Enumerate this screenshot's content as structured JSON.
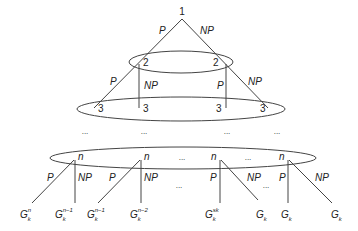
{
  "diagram": {
    "root": {
      "label": "1"
    },
    "edge_labels": {
      "p": "P",
      "np": "NP"
    },
    "level2": [
      {
        "label": "2"
      },
      {
        "label": "2"
      }
    ],
    "level3": [
      {
        "label": "3"
      },
      {
        "label": "3"
      },
      {
        "label": "3"
      },
      {
        "label": "3"
      }
    ],
    "ellipsis": "...",
    "leveln": [
      {
        "label": "n"
      },
      {
        "label": "n"
      },
      {
        "label": "n"
      },
      {
        "label": "n"
      }
    ],
    "leaves": [
      {
        "base": "G",
        "sub": "k",
        "sup": "n"
      },
      {
        "base": "G",
        "sub": "k",
        "sup": "n−1"
      },
      {
        "base": "G",
        "sub": "k",
        "sup": "n−1"
      },
      {
        "base": "G",
        "sub": "k",
        "sup": "n−2"
      },
      {
        "base": "G",
        "sub": "k",
        "sup": "sk"
      },
      {
        "base": "G",
        "sub": "k",
        "sup": ""
      },
      {
        "base": "G",
        "sub": "k",
        "sup": ""
      },
      {
        "base": "G",
        "sub": "k",
        "sup": ""
      }
    ]
  }
}
